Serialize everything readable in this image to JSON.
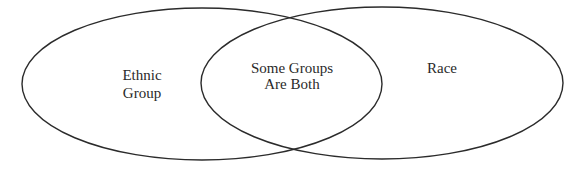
{
  "diagram": {
    "type": "venn",
    "stroke_color": "#2b2b2b",
    "sets": [
      {
        "id": "ethnic-group",
        "label_lines": [
          "Ethnic",
          "Group"
        ],
        "cx": 202,
        "cy": 84,
        "rx": 180,
        "ry": 76
      },
      {
        "id": "race",
        "label_lines": [
          "Race"
        ],
        "cx": 382,
        "cy": 83,
        "rx": 181,
        "ry": 76
      }
    ],
    "intersection": {
      "label_lines": [
        "Some Groups",
        "Are Both"
      ]
    }
  }
}
